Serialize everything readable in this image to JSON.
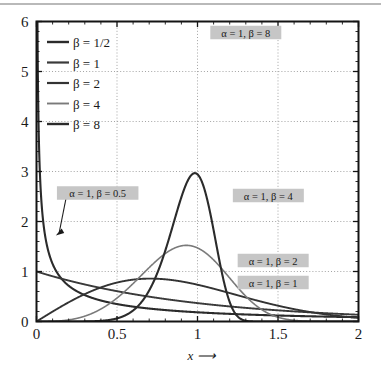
{
  "chart_data": {
    "type": "line",
    "title": "",
    "xlabel": "x ⟶",
    "ylabel": "",
    "xlim": [
      0,
      2
    ],
    "ylim": [
      0,
      6
    ],
    "xticks": [
      0,
      0.5,
      1,
      1.5,
      2
    ],
    "xticklabels": [
      "0",
      "0.5",
      "1",
      "1.5",
      "2"
    ],
    "yticks": [
      0,
      1,
      2,
      3,
      4,
      5,
      6
    ],
    "yticklabels": [
      "0",
      "1",
      "2",
      "3",
      "4",
      "5",
      "6"
    ],
    "minor_xticks_per_major": 5,
    "minor_yticks_per_major": 5,
    "grid": "dotted-major-both",
    "legend_position": "upper-left-inside",
    "legend": [
      {
        "label": "β = 1/2",
        "beta": 0.5,
        "color": "#2b2b2b",
        "width": 2.1
      },
      {
        "label": "β = 1",
        "beta": 1,
        "color": "#3a3a3a",
        "width": 1.9
      },
      {
        "label": "β = 2",
        "beta": 2,
        "color": "#333333",
        "width": 1.9
      },
      {
        "label": "β = 4",
        "beta": 4,
        "color": "#7a7a7a",
        "width": 1.6
      },
      {
        "label": "β = 8",
        "beta": 8,
        "color": "#2b2b2b",
        "width": 2.1
      }
    ],
    "series": [
      {
        "name": "beta=0.5",
        "alpha": 1,
        "beta": 0.5,
        "color": "#2b2b2b",
        "x": [
          0.004,
          0.01,
          0.02,
          0.03,
          0.05,
          0.08,
          0.12,
          0.18,
          0.25,
          0.35,
          0.5,
          0.7,
          0.9,
          1.2,
          1.5,
          1.75,
          2.0
        ],
        "y": [
          7.32,
          4.76,
          3.28,
          2.62,
          1.98,
          1.5,
          1.18,
          0.92,
          0.74,
          0.58,
          0.43,
          0.31,
          0.24,
          0.16,
          0.11,
          0.08,
          0.06
        ]
      },
      {
        "name": "beta=1",
        "alpha": 1,
        "beta": 1,
        "color": "#3a3a3a",
        "x": [
          0,
          0.25,
          0.5,
          0.75,
          1.0,
          1.25,
          1.5,
          1.75,
          2.0
        ],
        "y": [
          1.0,
          0.78,
          0.61,
          0.47,
          0.37,
          0.29,
          0.22,
          0.17,
          0.14
        ]
      },
      {
        "name": "beta=2",
        "alpha": 1,
        "beta": 2,
        "color": "#333333",
        "x": [
          0,
          0.25,
          0.5,
          0.707,
          0.9,
          1.0,
          1.25,
          1.5,
          1.75,
          2.0
        ],
        "y": [
          0.0,
          0.47,
          0.78,
          0.86,
          0.8,
          0.74,
          0.53,
          0.32,
          0.16,
          0.07
        ]
      },
      {
        "name": "beta=4",
        "alpha": 1,
        "beta": 4,
        "color": "#7a7a7a",
        "x": [
          0,
          0.25,
          0.5,
          0.75,
          1.0,
          1.1,
          1.25,
          1.4,
          1.6,
          1.8,
          2.0
        ],
        "y": [
          0.0,
          0.06,
          0.49,
          1.35,
          1.47,
          1.2,
          0.61,
          0.18,
          0.01,
          0.0,
          0.0
        ]
      },
      {
        "name": "beta=8",
        "alpha": 1,
        "beta": 8,
        "color": "#2b2b2b",
        "x": [
          0,
          0.5,
          0.75,
          0.9,
          1.0,
          1.05,
          1.1,
          1.2,
          1.3,
          1.4,
          1.5,
          1.7,
          2.0
        ],
        "y": [
          0.0,
          0.03,
          0.75,
          2.47,
          2.94,
          2.7,
          2.2,
          0.96,
          0.24,
          0.03,
          0.0,
          0.0,
          0.0
        ]
      }
    ],
    "annotations": [
      {
        "text": "α = 1, β = 8",
        "x": 1.3,
        "y": 5.78,
        "boxed": true,
        "arrow": false
      },
      {
        "text": "α = 1, β = 0.5",
        "x": 0.38,
        "y": 2.57,
        "boxed": true,
        "arrow": true,
        "arrow_to_x": 0.12,
        "arrow_to_y": 1.72
      },
      {
        "text": "α = 1, β = 4",
        "x": 1.44,
        "y": 2.52,
        "boxed": true,
        "arrow": false
      },
      {
        "text": "α = 1, β = 2",
        "x": 1.47,
        "y": 1.22,
        "boxed": true,
        "arrow": false
      },
      {
        "text": "α = 1, β = 1",
        "x": 1.47,
        "y": 0.78,
        "boxed": true,
        "arrow": false
      }
    ],
    "colors": {
      "axis": "#141414",
      "grid": "#9a9a9a",
      "annotation_box": "#c6c6c6",
      "annotation_text": "#1a1a1a",
      "background": "#ffffff",
      "top_rule": "#b9b9b9"
    }
  }
}
